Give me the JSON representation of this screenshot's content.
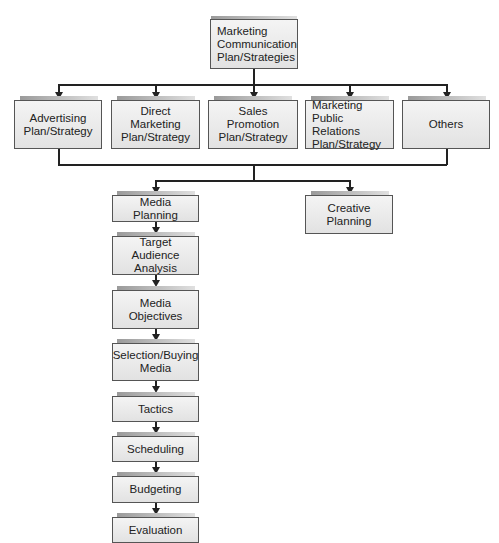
{
  "diagram": {
    "root": {
      "label": "Marketing\nCommunication\nPlan/Strategies"
    },
    "plans": [
      {
        "label": "Advertising\nPlan/Strategy"
      },
      {
        "label": "Direct Marketing\nPlan/Strategy"
      },
      {
        "label": "Sales Promotion\nPlan/Strategy"
      },
      {
        "label": "Marketing\nPublic Relations\nPlan/Strategy"
      },
      {
        "label": "Others"
      }
    ],
    "creative": {
      "label": "Creative\nPlanning"
    },
    "media_steps": [
      {
        "label": "Media Planning"
      },
      {
        "label": "Target Audience\nAnalysis"
      },
      {
        "label": "Media\nObjectives"
      },
      {
        "label": "Selection/Buying\nMedia"
      },
      {
        "label": "Tactics"
      },
      {
        "label": "Scheduling"
      },
      {
        "label": "Budgeting"
      },
      {
        "label": "Evaluation"
      }
    ],
    "colors": {
      "box_fill_top": "#f4f4f4",
      "box_fill_bottom": "#e2e2e2",
      "box_border": "#555555",
      "connector": "#222222",
      "tab": "#9a9a9a"
    }
  }
}
